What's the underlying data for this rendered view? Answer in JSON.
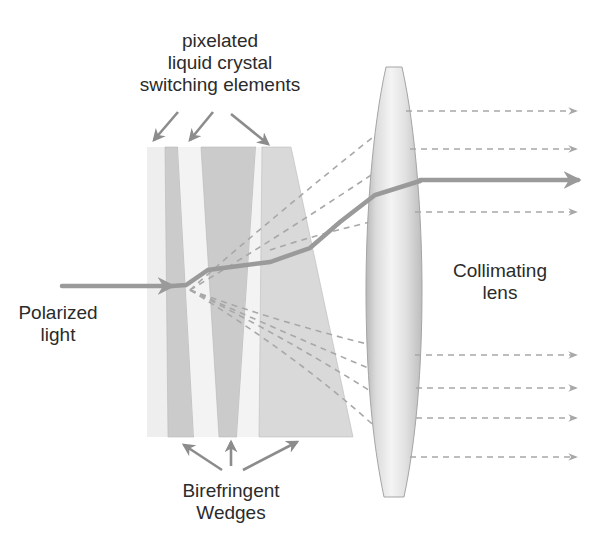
{
  "labels": {
    "switching_elements": [
      "pixelated",
      "liquid crystal",
      "switching elements"
    ],
    "input": [
      "Polarized",
      "light"
    ],
    "lens": [
      "Collimating",
      "lens"
    ],
    "wedges": [
      "Birefringent",
      "Wedges"
    ]
  },
  "colors": {
    "background": "#ffffff",
    "panel_light": "#ececec",
    "wedge_dark": "#c9c9c9",
    "wedge_mid": "#d9d9d9",
    "beam": "#9a9a9a",
    "dashed_ray": "#a8a8a8",
    "arrow": "#8c8c8c",
    "lens_edge": "#a0a0a0",
    "text": "#2b2b2b"
  },
  "components": {
    "input_beam": {
      "y": 286,
      "x_start": 62
    },
    "lens": {
      "center_x": 394,
      "top_y": 67,
      "bottom_y": 497
    },
    "output_main_beam_y": 180,
    "output_dashed_rays_y": [
      111,
      149,
      212,
      355,
      388,
      418,
      457
    ]
  }
}
